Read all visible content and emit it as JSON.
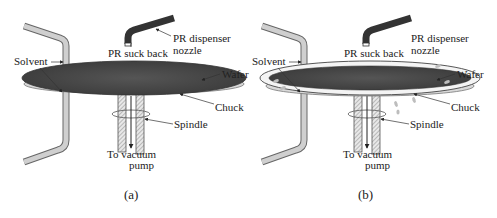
{
  "panels": [
    {
      "id": "a",
      "caption": "(a)",
      "labels": {
        "solvent": "Solvent",
        "suck_back": "PR suck back",
        "dispenser_line1": "PR dispenser",
        "dispenser_line2": "nozzle",
        "wafer": "Wafer",
        "chuck": "Chuck",
        "spindle": "Spindle",
        "vacuum_line1": "To vacuum",
        "vacuum_line2": "pump"
      }
    },
    {
      "id": "b",
      "caption": "(b)",
      "labels": {
        "solvent": "Solvent",
        "suck_back": "PR suck back",
        "dispenser_line1": "PR dispenser",
        "dispenser_line2": "nozzle",
        "wafer": "Wafer",
        "chuck": "Chuck",
        "spindle": "Spindle",
        "vacuum_line1": "To vacuum",
        "vacuum_line2": "pump"
      }
    }
  ],
  "colors": {
    "wafer_fill": "#4a4a4a",
    "tube_fill": "#c8c8c8",
    "nozzle_fill": "#3a3a3a",
    "droplet": "#bdbdbd"
  }
}
